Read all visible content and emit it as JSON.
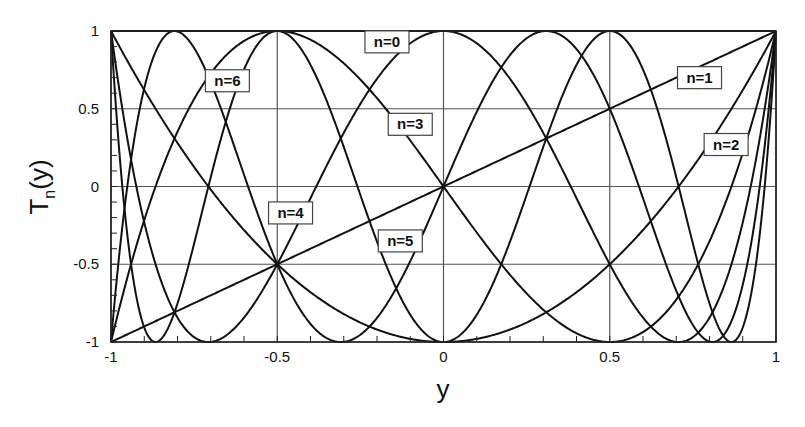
{
  "chart_data": {
    "type": "line",
    "title": "",
    "xlabel": "y",
    "ylabel": "T_n(y)",
    "ylabel_main": "T",
    "ylabel_sub": "n",
    "ylabel_tail": "(y)",
    "xlim": [
      -1,
      1
    ],
    "ylim": [
      -1,
      1
    ],
    "grid": true,
    "x_ticks": [
      -1,
      -0.5,
      0,
      0.5,
      1
    ],
    "x_tick_labels": [
      "-1",
      "-0.5",
      "0",
      "0.5",
      "1"
    ],
    "y_ticks": [
      1,
      0.5,
      0,
      -0.5,
      -1
    ],
    "y_tick_labels": [
      "1",
      "0.5",
      "0",
      "-0.5",
      "-1"
    ],
    "series": [
      {
        "name": "n=0",
        "n": 0,
        "label_pos": [
          -0.17,
          0.93
        ]
      },
      {
        "name": "n=1",
        "n": 1,
        "label_pos": [
          0.77,
          0.7
        ]
      },
      {
        "name": "n=2",
        "n": 2,
        "label_pos": [
          0.85,
          0.27
        ]
      },
      {
        "name": "n=3",
        "n": 3,
        "label_pos": [
          -0.1,
          0.4
        ]
      },
      {
        "name": "n=4",
        "n": 4,
        "label_pos": [
          -0.46,
          -0.17
        ]
      },
      {
        "name": "n=5",
        "n": 5,
        "label_pos": [
          -0.13,
          -0.35
        ]
      },
      {
        "name": "n=6",
        "n": 6,
        "label_pos": [
          -0.65,
          0.68
        ]
      }
    ],
    "sample_points": {
      "x": [
        -1,
        -0.75,
        -0.5,
        -0.25,
        0,
        0.25,
        0.5,
        0.75,
        1
      ],
      "n=0": [
        1,
        1,
        1,
        1,
        1,
        1,
        1,
        1,
        1
      ],
      "n=1": [
        -1,
        -0.75,
        -0.5,
        -0.25,
        0,
        0.25,
        0.5,
        0.75,
        1
      ],
      "n=2": [
        1,
        0.125,
        -0.5,
        -0.875,
        -1,
        -0.875,
        -0.5,
        0.125,
        1
      ],
      "n=3": [
        -1,
        0.5625,
        1,
        0.6875,
        0,
        -0.6875,
        -1,
        -0.5625,
        1
      ],
      "n=4": [
        1,
        -0.9688,
        -0.5,
        0.5313,
        1,
        0.5313,
        -0.5,
        -0.9688,
        1
      ],
      "n=5": [
        -1,
        0.8906,
        -0.5,
        -0.9531,
        0,
        0.9531,
        0.5,
        -0.8906,
        1
      ],
      "n=6": [
        1,
        -0.3672,
        1,
        -0.9453,
        -1,
        -0.9453,
        1,
        -0.3672,
        1
      ]
    },
    "legend_position": "inline labels"
  }
}
